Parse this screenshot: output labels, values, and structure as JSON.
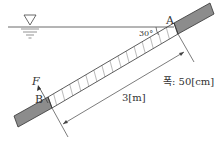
{
  "diagram": {
    "type": "inclined-gate-hydrostatics",
    "labels": {
      "point_a": "A",
      "point_b": "B",
      "force": "F",
      "angle": "30°",
      "length": "3[m]",
      "width": "폭: 50[cm]"
    },
    "symbols": {
      "water_surface": "water-surface-triangle-icon"
    },
    "colors": {
      "line": "#333333",
      "bar_fill": "#8c8c8c",
      "background": "#ffffff"
    }
  }
}
